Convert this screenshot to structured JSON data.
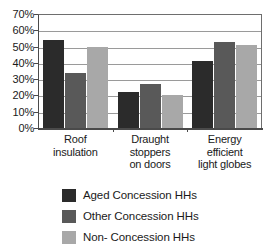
{
  "chart_data": {
    "type": "bar",
    "title": "",
    "subtitle": "",
    "xlabel": "",
    "ylabel": "",
    "ylim": [
      0,
      70
    ],
    "y_tick_step": 10,
    "y_tick_labels": [
      "70%",
      "60%",
      "50%",
      "40%",
      "30%",
      "20%",
      "10%",
      "0%"
    ],
    "y_tick_values": [
      70,
      60,
      50,
      40,
      30,
      20,
      10,
      0
    ],
    "grid": true,
    "grid_axis": "y",
    "legend_position": "bottom",
    "value_suffix": "%",
    "categories": [
      "Roof insulation",
      "Draught stoppers on doors",
      "Energy efficient light globes"
    ],
    "category_label_lines": [
      [
        "Roof",
        "insulation"
      ],
      [
        "Draught",
        "stoppers",
        "on doors"
      ],
      [
        "Energy",
        "efficient",
        "light globes"
      ]
    ],
    "series": [
      {
        "name": "Aged Concession HHs",
        "color": "#2b2b2b",
        "values": [
          54,
          22,
          41
        ]
      },
      {
        "name": "Other Concession HHs",
        "color": "#595959",
        "values": [
          34,
          27,
          53
        ]
      },
      {
        "name": "Non- Concession HHs",
        "color": "#a8a8a8",
        "values": [
          50,
          20,
          51
        ]
      }
    ]
  },
  "axis": {
    "colors": {
      "axis_line": "#4a4a4a",
      "gridline": "#9a9a9a",
      "plot_border": "#6e6e6e",
      "text": "#1a1a1a",
      "background": "#ffffff"
    }
  }
}
